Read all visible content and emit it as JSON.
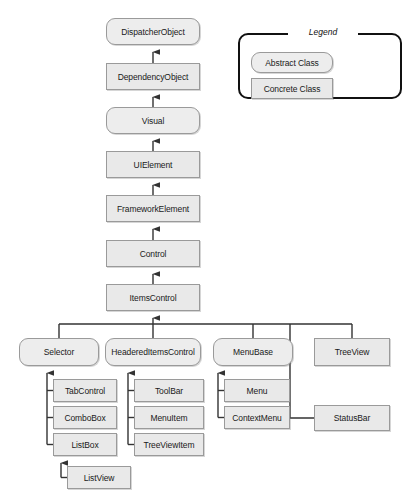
{
  "diagram": {
    "colors": {
      "node_fill": "#e9e9e9",
      "node_fill_abstract": "#ededed",
      "node_border": "#9a9a9a",
      "line": "#333333",
      "legend_border": "#111111",
      "text": "#1a1a1a",
      "background": "#ffffff"
    },
    "legend": {
      "title": "Legend",
      "items": [
        {
          "label": "Abstract Class",
          "kind": "abstract"
        },
        {
          "label": "Concrete Class",
          "kind": "concrete"
        }
      ]
    },
    "nodes": [
      {
        "id": "dispatcherobject",
        "label": "DispatcherObject",
        "kind": "abstract",
        "x": 106,
        "y": 18,
        "w": 94,
        "h": 27
      },
      {
        "id": "dependencyobject",
        "label": "DependencyObject",
        "kind": "concrete",
        "x": 106,
        "y": 63,
        "w": 94,
        "h": 27
      },
      {
        "id": "visual",
        "label": "Visual",
        "kind": "abstract",
        "x": 106,
        "y": 107,
        "w": 94,
        "h": 27
      },
      {
        "id": "uielement",
        "label": "UIElement",
        "kind": "concrete",
        "x": 106,
        "y": 151,
        "w": 94,
        "h": 27
      },
      {
        "id": "frameworkelement",
        "label": "FrameworkElement",
        "kind": "concrete",
        "x": 106,
        "y": 195,
        "w": 94,
        "h": 27
      },
      {
        "id": "control",
        "label": "Control",
        "kind": "concrete",
        "x": 106,
        "y": 240,
        "w": 94,
        "h": 27
      },
      {
        "id": "itemscontrol",
        "label": "ItemsControl",
        "kind": "concrete",
        "x": 106,
        "y": 284,
        "w": 94,
        "h": 27
      },
      {
        "id": "selector",
        "label": "Selector",
        "kind": "abstract",
        "x": 19,
        "y": 338,
        "w": 80,
        "h": 28
      },
      {
        "id": "headereditemscontrol",
        "label": "HeaderedItemsControl",
        "kind": "abstract",
        "x": 105,
        "y": 338,
        "w": 96,
        "h": 28
      },
      {
        "id": "menubase",
        "label": "MenuBase",
        "kind": "abstract",
        "x": 213,
        "y": 338,
        "w": 80,
        "h": 28
      },
      {
        "id": "treeview",
        "label": "TreeView",
        "kind": "concrete",
        "x": 314,
        "y": 338,
        "w": 76,
        "h": 28
      },
      {
        "id": "statusbar",
        "label": "StatusBar",
        "kind": "concrete",
        "x": 314,
        "y": 405,
        "w": 76,
        "h": 26
      },
      {
        "id": "tabcontrol",
        "label": "TabControl",
        "kind": "concrete",
        "x": 53,
        "y": 379,
        "w": 64,
        "h": 23
      },
      {
        "id": "combobox",
        "label": "ComboBox",
        "kind": "concrete",
        "x": 53,
        "y": 406,
        "w": 64,
        "h": 23
      },
      {
        "id": "listbox",
        "label": "ListBox",
        "kind": "concrete",
        "x": 53,
        "y": 433,
        "w": 64,
        "h": 23
      },
      {
        "id": "listview",
        "label": "ListView",
        "kind": "concrete",
        "x": 67,
        "y": 466,
        "w": 64,
        "h": 23
      },
      {
        "id": "toolbar",
        "label": "ToolBar",
        "kind": "concrete",
        "x": 134,
        "y": 379,
        "w": 70,
        "h": 23
      },
      {
        "id": "menuitem",
        "label": "MenuItem",
        "kind": "concrete",
        "x": 134,
        "y": 406,
        "w": 70,
        "h": 23
      },
      {
        "id": "treeviewitem",
        "label": "TreeViewItem",
        "kind": "concrete",
        "x": 134,
        "y": 433,
        "w": 70,
        "h": 23
      },
      {
        "id": "menu",
        "label": "Menu",
        "kind": "concrete",
        "x": 224,
        "y": 379,
        "w": 66,
        "h": 23
      },
      {
        "id": "contextmenu",
        "label": "ContextMenu",
        "kind": "concrete",
        "x": 224,
        "y": 406,
        "w": 66,
        "h": 23
      }
    ],
    "edges": [
      {
        "from": "dependencyobject",
        "to": "dispatcherobject",
        "type": "inherits"
      },
      {
        "from": "visual",
        "to": "dependencyobject",
        "type": "inherits"
      },
      {
        "from": "uielement",
        "to": "visual",
        "type": "inherits"
      },
      {
        "from": "frameworkelement",
        "to": "uielement",
        "type": "inherits"
      },
      {
        "from": "control",
        "to": "frameworkelement",
        "type": "inherits"
      },
      {
        "from": "itemscontrol",
        "to": "control",
        "type": "inherits"
      },
      {
        "from": "selector",
        "to": "itemscontrol",
        "type": "inherits"
      },
      {
        "from": "headereditemscontrol",
        "to": "itemscontrol",
        "type": "inherits"
      },
      {
        "from": "menubase",
        "to": "itemscontrol",
        "type": "inherits"
      },
      {
        "from": "treeview",
        "to": "itemscontrol",
        "type": "inherits"
      },
      {
        "from": "statusbar",
        "to": "itemscontrol",
        "type": "inherits"
      },
      {
        "from": "tabcontrol",
        "to": "selector",
        "type": "inherits"
      },
      {
        "from": "combobox",
        "to": "selector",
        "type": "inherits"
      },
      {
        "from": "listbox",
        "to": "selector",
        "type": "inherits"
      },
      {
        "from": "listview",
        "to": "listbox",
        "type": "inherits"
      },
      {
        "from": "toolbar",
        "to": "headereditemscontrol",
        "type": "inherits"
      },
      {
        "from": "menuitem",
        "to": "headereditemscontrol",
        "type": "inherits"
      },
      {
        "from": "treeviewitem",
        "to": "headereditemscontrol",
        "type": "inherits"
      },
      {
        "from": "menu",
        "to": "menubase",
        "type": "inherits"
      },
      {
        "from": "contextmenu",
        "to": "menubase",
        "type": "inherits"
      }
    ]
  }
}
